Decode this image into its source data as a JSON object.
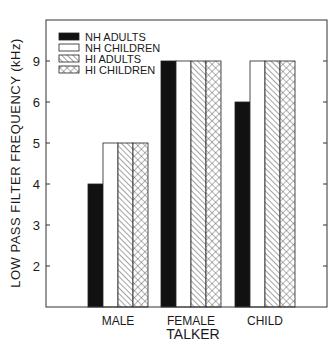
{
  "chart_data": {
    "type": "bar",
    "title": "",
    "xlabel": "TALKER",
    "ylabel": "LOW PASS FILTER FREQUENCY (kHz)",
    "categories": [
      "MALE",
      "FEMALE",
      "CHILD"
    ],
    "y_ticks": [
      "2",
      "3",
      "4",
      "5",
      "6",
      "9"
    ],
    "y_scale": "ordinal (ticks 2,3,4,5,6,9 equally spaced)",
    "grid": false,
    "legend_position": "top-left",
    "series": [
      {
        "name": "NH ADULTS",
        "pattern": "solid",
        "values": [
          4,
          9,
          6
        ]
      },
      {
        "name": "NH CHILDREN",
        "pattern": "open",
        "values": [
          5,
          9,
          9
        ]
      },
      {
        "name": "HI ADULTS",
        "pattern": "diagonal-hatch",
        "values": [
          5,
          9,
          9
        ]
      },
      {
        "name": "HI CHILDREN",
        "pattern": "crosshatch",
        "values": [
          5,
          9,
          9
        ]
      }
    ]
  }
}
